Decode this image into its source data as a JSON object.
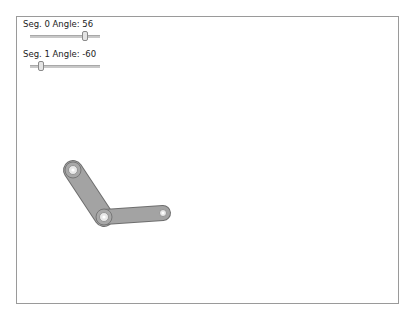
{
  "controls": {
    "seg0": {
      "label": "Seg. 0 Angle: 56",
      "angle": 56,
      "min": -180,
      "max": 180
    },
    "seg1": {
      "label": "Seg. 1 Angle: -60",
      "angle": -60,
      "min": -180,
      "max": 180
    }
  },
  "arm": {
    "fill": "#a0a0a0",
    "stroke": "#6e6e6e",
    "joints": [
      {
        "x": 73,
        "y": 170
      },
      {
        "x": 104,
        "y": 217
      },
      {
        "x": 163,
        "y": 213
      }
    ]
  }
}
